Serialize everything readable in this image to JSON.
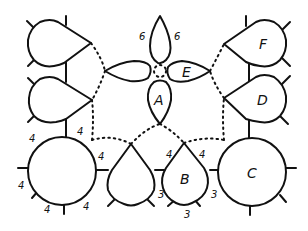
{
  "diagram": {
    "stroke_color": "#111111",
    "background": "#ffffff",
    "nodes": {
      "A": {
        "label": "A",
        "shape": "petal"
      },
      "B": {
        "label": "B",
        "shape": "teardrop"
      },
      "C": {
        "label": "C",
        "shape": "circle"
      },
      "D": {
        "label": "D",
        "shape": "teardrop"
      },
      "E": {
        "label": "E",
        "shape": "petal"
      },
      "F": {
        "label": "F",
        "shape": "teardrop"
      }
    },
    "numbers": {
      "top_petal_left": "6",
      "top_petal_right": "6",
      "circle_left_top_right": "4",
      "circle_left_top_left": "4",
      "circle_left_right": "4",
      "circle_left_left": "4",
      "circle_left_bottom_left": "4",
      "circle_left_bottom_right": "4",
      "b_top_left": "4",
      "b_top_right": "4",
      "b_left": "3",
      "b_right": "3",
      "b_bottom": "3"
    }
  }
}
